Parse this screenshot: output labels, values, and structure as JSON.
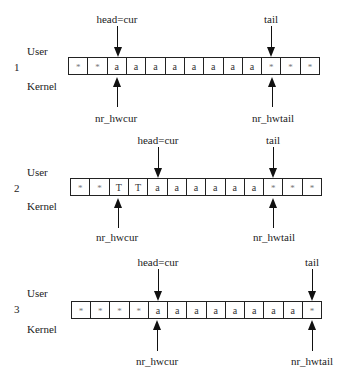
{
  "labels": {
    "user": "User",
    "kernel": "Kernel",
    "head_cur": "head=cur",
    "tail": "tail",
    "nr_hwcur": "nr_hwcur",
    "nr_hwtail": "nr_hwtail"
  },
  "panels": [
    {
      "number": "1",
      "cells": [
        "*",
        "*",
        "a",
        "a",
        "a",
        "a",
        "a",
        "a",
        "a",
        "a",
        "*",
        "*",
        "*"
      ],
      "head_cur_index": 2,
      "tail_index": 10,
      "nr_hwcur_index": 2,
      "nr_hwtail_index": 10
    },
    {
      "number": "2",
      "cells": [
        "*",
        "*",
        "T",
        "T",
        "a",
        "a",
        "a",
        "a",
        "a",
        "a",
        "*",
        "*",
        "*"
      ],
      "head_cur_index": 4,
      "tail_index": 10,
      "nr_hwcur_index": 2,
      "nr_hwtail_index": 10
    },
    {
      "number": "3",
      "cells": [
        "*",
        "*",
        "*",
        "*",
        "a",
        "a",
        "a",
        "a",
        "a",
        "a",
        "a",
        "a",
        "*"
      ],
      "head_cur_index": 4,
      "tail_index": 12,
      "nr_hwcur_index": 4,
      "nr_hwtail_index": 12
    }
  ]
}
